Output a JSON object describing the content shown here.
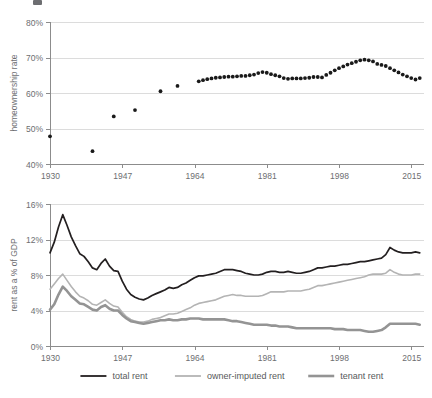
{
  "chart_data": [
    {
      "type": "scatter",
      "id": "homeownership",
      "title": "",
      "xlabel": "",
      "ylabel": "homeownership rate",
      "xlim": [
        1930,
        2018
      ],
      "ylim": [
        40,
        80
      ],
      "xticks": [
        1930,
        1947,
        1964,
        1981,
        1998,
        2015
      ],
      "xticklabels": [
        "1930",
        "1947",
        "1964",
        "1981",
        "1998",
        "2015"
      ],
      "yticks": [
        40,
        50,
        60,
        70,
        80
      ],
      "yticklabels": [
        "40%",
        "50%",
        "60%",
        "70%",
        "80%"
      ],
      "grid": "horizontal",
      "legend": "none",
      "marker_color": "#1a1a1a",
      "x": [
        1930,
        1940,
        1945,
        1950,
        1956,
        1960,
        1965,
        1966,
        1967,
        1968,
        1969,
        1970,
        1971,
        1972,
        1973,
        1974,
        1975,
        1976,
        1977,
        1978,
        1979,
        1980,
        1981,
        1982,
        1983,
        1984,
        1985,
        1986,
        1987,
        1988,
        1989,
        1990,
        1991,
        1992,
        1993,
        1994,
        1995,
        1996,
        1997,
        1998,
        1999,
        2000,
        2001,
        2002,
        2003,
        2004,
        2005,
        2006,
        2007,
        2008,
        2009,
        2010,
        2011,
        2012,
        2013,
        2014,
        2015,
        2016,
        2017
      ],
      "values": [
        47.8,
        43.6,
        53.4,
        55.2,
        60.5,
        62.0,
        63.3,
        63.6,
        63.9,
        64.1,
        64.3,
        64.4,
        64.5,
        64.6,
        64.6,
        64.7,
        64.8,
        64.8,
        65.0,
        65.2,
        65.6,
        65.9,
        65.7,
        65.3,
        65.0,
        64.7,
        64.2,
        64.0,
        64.1,
        64.1,
        64.1,
        64.2,
        64.3,
        64.5,
        64.5,
        64.4,
        65.1,
        65.7,
        66.4,
        67.0,
        67.5,
        68.0,
        68.4,
        68.8,
        69.2,
        69.4,
        69.2,
        68.9,
        68.2,
        67.9,
        67.6,
        67.0,
        66.4,
        65.8,
        65.2,
        64.7,
        64.2,
        63.8,
        64.2
      ]
    },
    {
      "type": "line",
      "id": "rent-gdp",
      "title": "",
      "xlabel": "",
      "ylabel": "rent as a % of GDP",
      "xlim": [
        1930,
        2018
      ],
      "ylim": [
        0,
        16
      ],
      "xticks": [
        1930,
        1947,
        1964,
        1981,
        1998,
        2015
      ],
      "xticklabels": [
        "1930",
        "1947",
        "1964",
        "1981",
        "1998",
        "2015"
      ],
      "yticks": [
        0,
        4,
        8,
        12,
        16
      ],
      "yticklabels": [
        "0%",
        "4%",
        "8%",
        "12%",
        "16%"
      ],
      "grid": "horizontal",
      "legend": "bottom",
      "x": [
        1930,
        1931,
        1932,
        1933,
        1934,
        1935,
        1936,
        1937,
        1938,
        1939,
        1940,
        1941,
        1942,
        1943,
        1944,
        1945,
        1946,
        1947,
        1948,
        1949,
        1950,
        1951,
        1952,
        1953,
        1954,
        1955,
        1956,
        1957,
        1958,
        1959,
        1960,
        1961,
        1962,
        1963,
        1964,
        1965,
        1966,
        1967,
        1968,
        1969,
        1970,
        1971,
        1972,
        1973,
        1974,
        1975,
        1976,
        1977,
        1978,
        1979,
        1980,
        1981,
        1982,
        1983,
        1984,
        1985,
        1986,
        1987,
        1988,
        1989,
        1990,
        1991,
        1992,
        1993,
        1994,
        1995,
        1996,
        1997,
        1998,
        1999,
        2000,
        2001,
        2002,
        2003,
        2004,
        2005,
        2006,
        2007,
        2008,
        2009,
        2010,
        2011,
        2012,
        2013,
        2014,
        2015,
        2016,
        2017
      ],
      "series": [
        {
          "name": "total rent",
          "color": "#231f20",
          "width": 1.7,
          "values": [
            10.5,
            11.7,
            13.4,
            14.8,
            13.6,
            12.3,
            11.3,
            10.4,
            10.1,
            9.5,
            8.8,
            8.6,
            9.3,
            9.8,
            9.0,
            8.5,
            8.4,
            7.3,
            6.4,
            5.8,
            5.5,
            5.3,
            5.2,
            5.4,
            5.7,
            5.9,
            6.1,
            6.3,
            6.6,
            6.5,
            6.6,
            6.9,
            7.1,
            7.4,
            7.7,
            7.9,
            7.9,
            8.0,
            8.1,
            8.2,
            8.4,
            8.6,
            8.6,
            8.6,
            8.5,
            8.4,
            8.2,
            8.1,
            8.0,
            8.0,
            8.1,
            8.3,
            8.4,
            8.4,
            8.3,
            8.3,
            8.4,
            8.3,
            8.2,
            8.2,
            8.3,
            8.4,
            8.6,
            8.8,
            8.8,
            8.9,
            9.0,
            9.0,
            9.1,
            9.2,
            9.2,
            9.3,
            9.4,
            9.5,
            9.5,
            9.6,
            9.7,
            9.8,
            9.9,
            10.3,
            11.1,
            10.8,
            10.6,
            10.5,
            10.5,
            10.5,
            10.6,
            10.5
          ]
        },
        {
          "name": "owner-imputed rent",
          "color": "#b4b4b4",
          "width": 1.6,
          "values": [
            6.4,
            7.0,
            7.6,
            8.1,
            7.4,
            6.7,
            6.1,
            5.6,
            5.4,
            5.1,
            4.7,
            4.6,
            4.9,
            5.2,
            4.8,
            4.5,
            4.4,
            3.8,
            3.3,
            3.0,
            2.8,
            2.7,
            2.7,
            2.8,
            3.0,
            3.1,
            3.2,
            3.4,
            3.6,
            3.6,
            3.7,
            3.9,
            4.1,
            4.3,
            4.6,
            4.8,
            4.9,
            5.0,
            5.1,
            5.2,
            5.4,
            5.6,
            5.7,
            5.8,
            5.7,
            5.7,
            5.6,
            5.6,
            5.6,
            5.6,
            5.7,
            5.9,
            6.1,
            6.1,
            6.1,
            6.1,
            6.2,
            6.2,
            6.2,
            6.2,
            6.3,
            6.4,
            6.6,
            6.8,
            6.8,
            6.9,
            7.0,
            7.1,
            7.2,
            7.3,
            7.4,
            7.5,
            7.6,
            7.7,
            7.8,
            8.0,
            8.1,
            8.1,
            8.1,
            8.2,
            8.6,
            8.3,
            8.1,
            8.0,
            8.0,
            8.0,
            8.1,
            8.1
          ]
        },
        {
          "name": "tenant rent",
          "color": "#949494",
          "width": 2.6,
          "values": [
            4.1,
            4.7,
            5.8,
            6.7,
            6.2,
            5.6,
            5.2,
            4.8,
            4.7,
            4.4,
            4.1,
            4.0,
            4.4,
            4.6,
            4.2,
            4.0,
            4.0,
            3.5,
            3.1,
            2.8,
            2.7,
            2.6,
            2.5,
            2.6,
            2.7,
            2.8,
            2.9,
            2.9,
            3.0,
            2.9,
            2.9,
            3.0,
            3.0,
            3.1,
            3.1,
            3.1,
            3.0,
            3.0,
            3.0,
            3.0,
            3.0,
            3.0,
            2.9,
            2.8,
            2.8,
            2.7,
            2.6,
            2.5,
            2.4,
            2.4,
            2.4,
            2.4,
            2.3,
            2.3,
            2.2,
            2.2,
            2.2,
            2.1,
            2.0,
            2.0,
            2.0,
            2.0,
            2.0,
            2.0,
            2.0,
            2.0,
            2.0,
            1.9,
            1.9,
            1.9,
            1.8,
            1.8,
            1.8,
            1.8,
            1.7,
            1.6,
            1.6,
            1.7,
            1.8,
            2.1,
            2.5,
            2.5,
            2.5,
            2.5,
            2.5,
            2.5,
            2.5,
            2.4
          ]
        }
      ]
    }
  ],
  "panels": {
    "top": {
      "ylabel": "homeownership rate",
      "yticklabels": [
        "80%",
        "70%",
        "60%",
        "50%",
        "40%"
      ],
      "xticklabels": [
        "1930",
        "1947",
        "1964",
        "1981",
        "1998",
        "2015"
      ]
    },
    "bottom": {
      "ylabel": "rent as a % of GDP",
      "yticklabels": [
        "16%",
        "12%",
        "8%",
        "4%",
        "0%"
      ],
      "xticklabels": [
        "1930",
        "1947",
        "1964",
        "1981",
        "1998",
        "2015"
      ],
      "legend": [
        {
          "label": "total rent",
          "color": "#231f20"
        },
        {
          "label": "owner-imputed rent",
          "color": "#b4b4b4"
        },
        {
          "label": "tenant rent",
          "color": "#949494"
        }
      ]
    }
  }
}
